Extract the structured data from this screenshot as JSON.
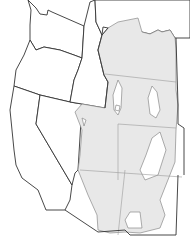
{
  "map": {
    "title": "",
    "region": "Western United States",
    "colors": {
      "background": "#ffffff",
      "state_fill": "#ffffff",
      "state_border": "#333333",
      "range_fill": "#e8e8e8",
      "range_border": "#8a8a8a"
    },
    "states": [
      "Washington",
      "Oregon",
      "California",
      "Idaho",
      "Nevada",
      "Montana",
      "Wyoming",
      "Utah",
      "Colorado",
      "Arizona",
      "New Mexico"
    ],
    "shaded_region": "Distribution range covering parts of Montana, Wyoming, Colorado, Utah, Arizona, New Mexico"
  }
}
